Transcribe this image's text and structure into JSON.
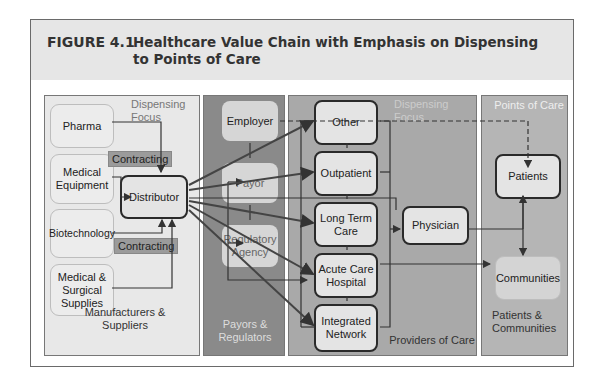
{
  "figure": {
    "number": "FIGURE 4.1",
    "title": "Healthcare Value Chain with Emphasis on Dispensing to Points of Care"
  },
  "panels": {
    "manufacturers": {
      "label": "Manufacturers & Suppliers",
      "focus_label": "Dispensing Focus",
      "nodes": [
        "Pharma",
        "Medical Equipment",
        "Biotechnology",
        "Medical & Surgical Supplies"
      ],
      "distributor": "Distributor",
      "contracting_labels": [
        "Contracting",
        "Contracting"
      ]
    },
    "payors": {
      "label": "Payors & Regulators",
      "nodes": [
        "Employer",
        "Payor",
        "Regulatory Agency"
      ]
    },
    "providers": {
      "label": "Providers of Care",
      "focus_label": "Dispensing Focus",
      "nodes": [
        "Other",
        "Outpatient",
        "Long Term Care",
        "Acute Care Hospital",
        "Integrated Network"
      ],
      "physician": "Physician"
    },
    "points": {
      "label_top": "Points of Care",
      "label_bottom": "Patients & Communities",
      "nodes": [
        "Patients",
        "Communities"
      ]
    }
  },
  "colors": {
    "header_bg": "#e6e6e6",
    "panel_manufacturers": "#e8e8e8",
    "panel_payors": "#8a8a8a",
    "panel_providers": "#a9a9a9",
    "panel_points": "#b5b5b5",
    "arrow": "#3a3a3a"
  }
}
